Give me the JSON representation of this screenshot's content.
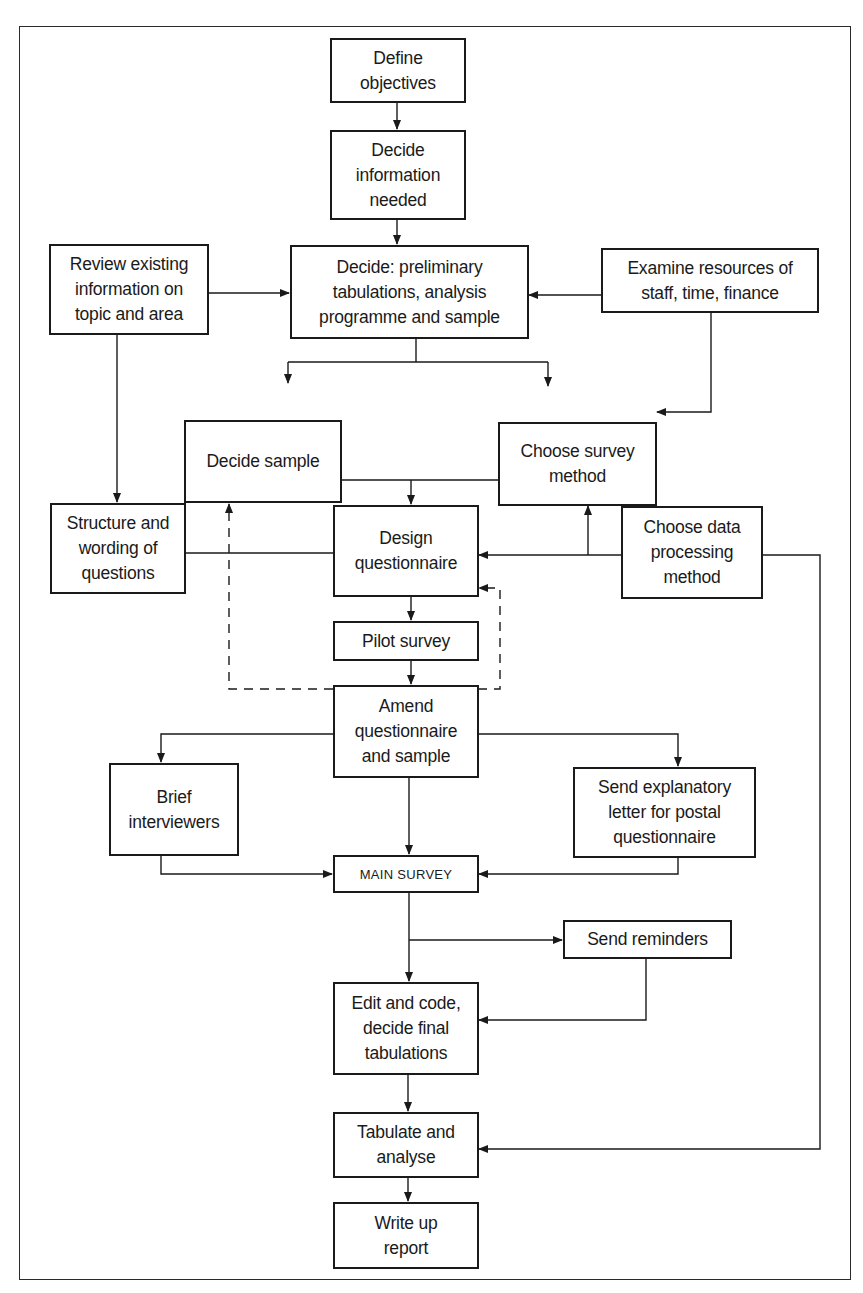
{
  "diagram": {
    "type": "flowchart",
    "nodes": [
      {
        "id": "define",
        "label": "Define\nobjectives"
      },
      {
        "id": "info",
        "label": "Decide\ninformation\nneeded"
      },
      {
        "id": "review",
        "label": "Review existing\ninformation on\ntopic and area"
      },
      {
        "id": "prelim",
        "label": "Decide: preliminary\ntabulations, analysis\nprogramme and sample"
      },
      {
        "id": "resources",
        "label": "Examine resources of\nstaff, time, finance"
      },
      {
        "id": "sample",
        "label": "Decide sample"
      },
      {
        "id": "method",
        "label": "Choose survey\nmethod"
      },
      {
        "id": "structure",
        "label": "Structure and\nwording of\nquestions"
      },
      {
        "id": "design",
        "label": "Design\nquestionnaire"
      },
      {
        "id": "dataproc",
        "label": "Choose data\nprocessing\nmethod"
      },
      {
        "id": "pilot",
        "label": "Pilot survey"
      },
      {
        "id": "amend",
        "label": "Amend\nquestionnaire\nand sample"
      },
      {
        "id": "brief",
        "label": "Brief\ninterviewers"
      },
      {
        "id": "letter",
        "label": "Send explanatory\nletter for postal\nquestionnaire"
      },
      {
        "id": "main",
        "label": "MAIN SURVEY"
      },
      {
        "id": "reminders",
        "label": "Send reminders"
      },
      {
        "id": "edit",
        "label": "Edit and code,\ndecide final\ntabulations"
      },
      {
        "id": "tabulate",
        "label": "Tabulate and\nanalyse"
      },
      {
        "id": "report",
        "label": "Write up\nreport"
      }
    ],
    "edges": [
      {
        "from": "define",
        "to": "info",
        "style": "solid"
      },
      {
        "from": "info",
        "to": "prelim",
        "style": "solid"
      },
      {
        "from": "review",
        "to": "prelim",
        "style": "solid"
      },
      {
        "from": "resources",
        "to": "prelim",
        "style": "solid"
      },
      {
        "from": "prelim",
        "to": "sample",
        "style": "solid"
      },
      {
        "from": "prelim",
        "to": "method",
        "style": "solid"
      },
      {
        "from": "resources",
        "to": "method",
        "style": "solid"
      },
      {
        "from": "review",
        "to": "structure",
        "style": "solid"
      },
      {
        "from": "sample",
        "to": "design",
        "style": "solid"
      },
      {
        "from": "method",
        "to": "design",
        "style": "solid"
      },
      {
        "from": "structure",
        "to": "design",
        "style": "solid"
      },
      {
        "from": "dataproc",
        "to": "design",
        "style": "solid"
      },
      {
        "from": "dataproc",
        "to": "method",
        "style": "solid"
      },
      {
        "from": "design",
        "to": "pilot",
        "style": "solid"
      },
      {
        "from": "pilot",
        "to": "amend",
        "style": "solid"
      },
      {
        "from": "amend",
        "to": "sample",
        "style": "dashed"
      },
      {
        "from": "amend",
        "to": "design",
        "style": "dashed"
      },
      {
        "from": "amend",
        "to": "brief",
        "style": "solid"
      },
      {
        "from": "amend",
        "to": "letter",
        "style": "solid"
      },
      {
        "from": "amend",
        "to": "main",
        "style": "solid"
      },
      {
        "from": "brief",
        "to": "main",
        "style": "solid"
      },
      {
        "from": "letter",
        "to": "main",
        "style": "solid"
      },
      {
        "from": "main",
        "to": "reminders",
        "style": "solid"
      },
      {
        "from": "main",
        "to": "edit",
        "style": "solid"
      },
      {
        "from": "reminders",
        "to": "edit",
        "style": "solid"
      },
      {
        "from": "edit",
        "to": "tabulate",
        "style": "solid"
      },
      {
        "from": "dataproc",
        "to": "tabulate",
        "style": "solid"
      },
      {
        "from": "tabulate",
        "to": "report",
        "style": "solid"
      }
    ]
  },
  "colors": {
    "line": "#1a1a1a",
    "background": "#ffffff"
  }
}
